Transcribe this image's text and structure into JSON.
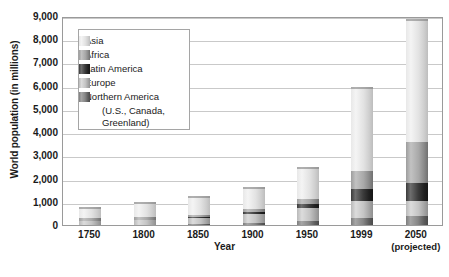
{
  "chart_data": {
    "type": "bar",
    "subtype": "stacked-bar",
    "title": "",
    "xlabel": "Year",
    "ylabel": "World population (in millions)",
    "ylim": [
      0,
      9000
    ],
    "ytick_step": 1000,
    "grid": true,
    "legend_position": "upper-left-inside",
    "categories": [
      "1750",
      "1800",
      "1850",
      "1900",
      "1950",
      "1999",
      "2050"
    ],
    "category_sublabels": [
      "",
      "",
      "",
      "",
      "",
      "",
      "(projected)"
    ],
    "ytick_labels": [
      "0",
      "1,000",
      "2,000",
      "3,000",
      "4,000",
      "5,000",
      "6,000",
      "7,000",
      "8,000",
      "9,000"
    ],
    "series": [
      {
        "name": "Northern America (U.S., Canada, Greenland)",
        "key": "namer",
        "color": "#7d7d7d",
        "values": [
          2,
          7,
          26,
          82,
          172,
          307,
          392
        ]
      },
      {
        "name": "Europe",
        "key": "europe",
        "color": "#c4c4c4",
        "values": [
          163,
          203,
          276,
          408,
          547,
          729,
          628
        ]
      },
      {
        "name": "Latin America",
        "key": "latin",
        "color": "#2b2b2b",
        "values": [
          16,
          24,
          38,
          74,
          167,
          511,
          809
        ]
      },
      {
        "name": "Africa",
        "key": "africa",
        "color": "#a8a8a8",
        "values": [
          106,
          107,
          111,
          133,
          221,
          767,
          1766
        ]
      },
      {
        "name": "Asia",
        "key": "asia",
        "color": "#eeeeee",
        "values": [
          502,
          635,
          809,
          947,
          1402,
          3634,
          5268
        ]
      }
    ],
    "totals": [
      789,
      976,
      1260,
      1644,
      2509,
      5948,
      8863
    ],
    "stack_order_bottom_to_top": [
      "namer",
      "europe",
      "latin",
      "africa",
      "asia"
    ]
  },
  "legend": {
    "items": [
      {
        "label": "Asia",
        "swatch": "asia"
      },
      {
        "label": "Africa",
        "swatch": "africa"
      },
      {
        "label": "Latin America",
        "swatch": "latin"
      },
      {
        "label": "Europe",
        "swatch": "europe"
      },
      {
        "label": "Northern America",
        "swatch": "namer"
      }
    ],
    "continuation_lines": [
      "(U.S., Canada,",
      "Greenland)"
    ]
  }
}
